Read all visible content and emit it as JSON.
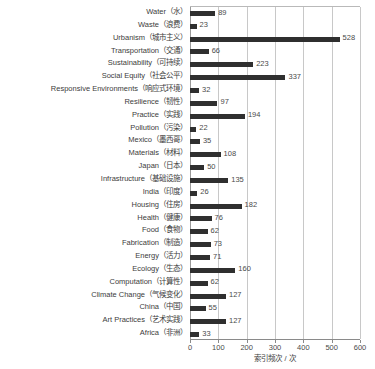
{
  "chart_data": {
    "type": "bar",
    "orientation": "horizontal",
    "title": "",
    "xlabel": "索引频次 / 次",
    "ylabel": "",
    "xlim": [
      0,
      600
    ],
    "xticks": [
      0,
      100,
      200,
      300,
      400,
      500,
      600
    ],
    "grid": true,
    "legend": false,
    "bar_color": "#2f2f2f",
    "categories": [
      "Water（水）",
      "Waste（浪费）",
      "Urbanism（城市主义）",
      "Transportation（交通）",
      "Sustainability（可持续）",
      "Social Equity（社会公平）",
      "Responsive Environments（响应式环境）",
      "Resilience（韧性）",
      "Practice（实践）",
      "Pollution（污染）",
      "Mexico（墨西哥）",
      "Materials（材料）",
      "Japan（日本）",
      "Infrastructure（基础设施）",
      "India（印度）",
      "Housing（住房）",
      "Health（健康）",
      "Food（食物）",
      "Fabrication（制造）",
      "Energy（活力）",
      "Ecology（生态）",
      "Computation（计算性）",
      "Climate Change（气候变化）",
      "China（中国）",
      "Art Practices（艺术实践）",
      "Africa（非洲）"
    ],
    "values": [
      89,
      23,
      528,
      66,
      223,
      337,
      32,
      97,
      194,
      22,
      35,
      108,
      50,
      135,
      26,
      182,
      76,
      62,
      73,
      71,
      160,
      62,
      127,
      55,
      127,
      33
    ]
  }
}
